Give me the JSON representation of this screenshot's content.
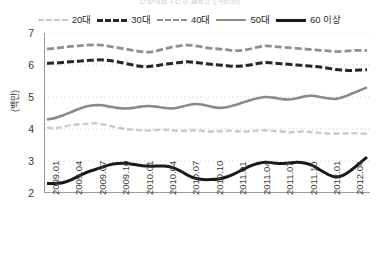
{
  "title": {
    "text": "연령대별 1인당 월평균 (백만원)",
    "visible_partial": true
  },
  "y_axis_title": "(백만)",
  "legend": {
    "items": [
      {
        "label": "20대",
        "color": "#c9c9c9",
        "style": "dashed",
        "width": 2.4
      },
      {
        "label": "30대",
        "color": "#262626",
        "style": "dashed",
        "width": 3.0
      },
      {
        "label": "40대",
        "color": "#8f8f8f",
        "style": "dashed",
        "width": 2.8
      },
      {
        "label": "50대",
        "color": "#8a8a8a",
        "style": "solid",
        "width": 2.6
      },
      {
        "label": "60 이상",
        "color": "#1a1a1a",
        "style": "solid",
        "width": 3.0
      }
    ]
  },
  "chart_data": {
    "type": "line",
    "title": "연령대별 1인당 월평균 (백만원)",
    "xlabel": "",
    "ylabel": "(백만)",
    "ylim": [
      2,
      7
    ],
    "yticks": [
      2,
      3,
      4,
      5,
      6,
      7
    ],
    "grid": true,
    "legend_position": "top",
    "x_tick_labels": [
      "2009.01",
      "2009.04",
      "2009.07",
      "2009.10",
      "2010.01",
      "2010.04",
      "2010.07",
      "2010.10",
      "2011.01",
      "2011.04",
      "2011.07",
      "2011.10",
      "2012.01",
      "2012.04"
    ],
    "x": [
      "2009.01",
      "2009.02",
      "2009.03",
      "2009.04",
      "2009.05",
      "2009.06",
      "2009.07",
      "2009.08",
      "2009.09",
      "2009.10",
      "2009.11",
      "2009.12",
      "2010.01",
      "2010.02",
      "2010.03",
      "2010.04",
      "2010.05",
      "2010.06",
      "2010.07",
      "2010.08",
      "2010.09",
      "2010.10",
      "2010.11",
      "2010.12",
      "2011.01",
      "2011.02",
      "2011.03",
      "2011.04",
      "2011.05",
      "2011.06",
      "2011.07",
      "2011.08",
      "2011.09",
      "2011.10",
      "2011.11",
      "2011.12",
      "2012.01",
      "2012.02",
      "2012.03",
      "2012.04",
      "2012.05",
      "2012.06"
    ],
    "series": [
      {
        "name": "20대",
        "color": "#c9c9c9",
        "style": "dashed",
        "values": [
          4.05,
          4.02,
          4.06,
          4.12,
          4.14,
          4.16,
          4.18,
          4.15,
          4.1,
          4.05,
          4.0,
          3.98,
          3.96,
          3.95,
          3.97,
          3.98,
          3.96,
          3.94,
          3.95,
          3.96,
          3.94,
          3.92,
          3.93,
          3.95,
          3.94,
          3.92,
          3.93,
          3.95,
          3.96,
          3.94,
          3.92,
          3.9,
          3.91,
          3.92,
          3.9,
          3.88,
          3.86,
          3.85,
          3.86,
          3.87,
          3.86,
          3.85
        ]
      },
      {
        "name": "30대",
        "color": "#262626",
        "style": "dashed",
        "values": [
          6.05,
          6.06,
          6.08,
          6.1,
          6.12,
          6.14,
          6.15,
          6.16,
          6.14,
          6.1,
          6.05,
          6.0,
          5.96,
          5.95,
          5.98,
          6.02,
          6.05,
          6.08,
          6.1,
          6.08,
          6.05,
          6.02,
          6.0,
          5.98,
          5.96,
          5.97,
          6.0,
          6.05,
          6.08,
          6.06,
          6.04,
          6.02,
          6.0,
          5.98,
          5.96,
          5.94,
          5.9,
          5.86,
          5.84,
          5.83,
          5.84,
          5.85
        ]
      },
      {
        "name": "40대",
        "color": "#8f8f8f",
        "style": "dashed",
        "values": [
          6.5,
          6.52,
          6.55,
          6.58,
          6.6,
          6.62,
          6.63,
          6.62,
          6.58,
          6.54,
          6.5,
          6.46,
          6.42,
          6.4,
          6.44,
          6.5,
          6.56,
          6.6,
          6.62,
          6.6,
          6.56,
          6.52,
          6.5,
          6.48,
          6.45,
          6.46,
          6.5,
          6.56,
          6.6,
          6.58,
          6.56,
          6.54,
          6.52,
          6.5,
          6.48,
          6.46,
          6.44,
          6.42,
          6.43,
          6.45,
          6.46,
          6.45
        ]
      },
      {
        "name": "50대",
        "color": "#8a8a8a",
        "style": "solid",
        "values": [
          4.3,
          4.34,
          4.42,
          4.52,
          4.62,
          4.7,
          4.74,
          4.74,
          4.7,
          4.66,
          4.64,
          4.66,
          4.7,
          4.72,
          4.7,
          4.66,
          4.64,
          4.68,
          4.74,
          4.78,
          4.76,
          4.7,
          4.66,
          4.68,
          4.74,
          4.82,
          4.9,
          4.96,
          5.0,
          4.98,
          4.94,
          4.92,
          4.96,
          5.02,
          5.04,
          5.0,
          4.96,
          4.94,
          5.0,
          5.1,
          5.2,
          5.3
        ]
      },
      {
        "name": "60 이상",
        "color": "#1a1a1a",
        "style": "solid",
        "values": [
          2.3,
          2.3,
          2.32,
          2.4,
          2.52,
          2.64,
          2.72,
          2.8,
          2.88,
          2.92,
          2.93,
          2.9,
          2.86,
          2.84,
          2.84,
          2.84,
          2.8,
          2.7,
          2.56,
          2.46,
          2.42,
          2.42,
          2.44,
          2.5,
          2.6,
          2.72,
          2.84,
          2.92,
          2.96,
          2.94,
          2.92,
          2.94,
          2.96,
          2.94,
          2.86,
          2.72,
          2.58,
          2.5,
          2.56,
          2.72,
          2.92,
          3.12
        ]
      }
    ]
  }
}
